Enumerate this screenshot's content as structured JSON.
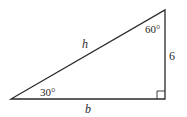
{
  "diagram": {
    "type": "right-triangle",
    "vertices": {
      "bottom_left": [
        11,
        99
      ],
      "right_angle": [
        165,
        99
      ],
      "top": [
        165,
        10
      ]
    },
    "colors": {
      "stroke": "#2a2a2a",
      "background": "#ffffff"
    },
    "labels": {
      "hypotenuse": "h",
      "base": "b",
      "height": "6",
      "angle_bottom_left": "30°",
      "angle_top": "60°"
    }
  }
}
